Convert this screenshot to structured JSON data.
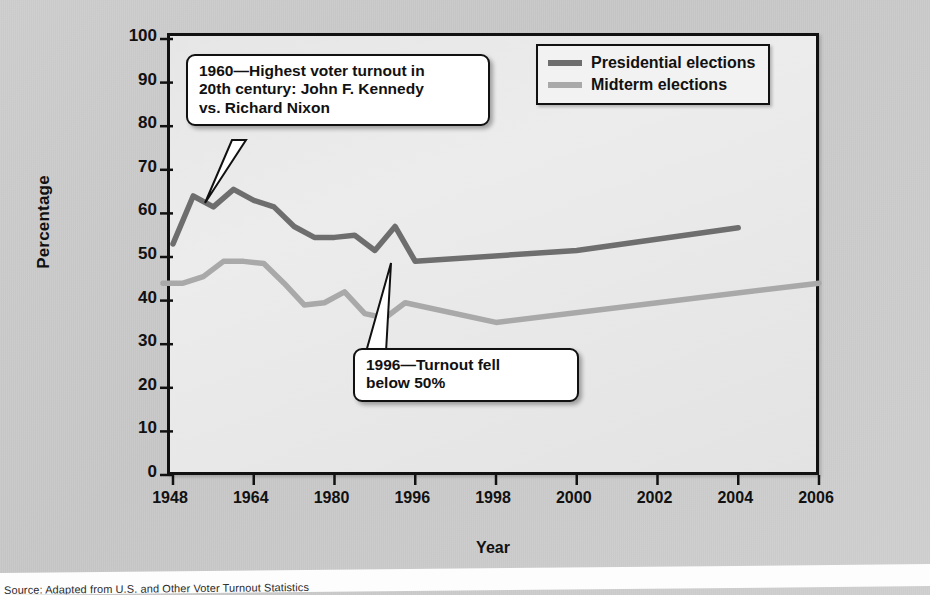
{
  "figure": {
    "ylabel": "Percentage",
    "xlabel": "Year"
  },
  "legend": {
    "position": "top-right",
    "items": [
      {
        "label": "Presidential elections",
        "color": "#6e6e6e"
      },
      {
        "label": "Midterm elections",
        "color": "#a9a9a9"
      }
    ]
  },
  "callouts": [
    {
      "name": "callout-1960",
      "text": "1960—Highest voter turnout in\n20th century: John F. Kennedy\nvs. Richard Nixon"
    },
    {
      "name": "callout-1996",
      "text": "1996—Turnout fell\nbelow 50%"
    }
  ],
  "caption": {
    "text": "Source: Adapted from U.S. and Other Voter Turnout Statistics"
  },
  "chart_data": {
    "type": "line",
    "title": "",
    "xlabel": "Year",
    "ylabel": "Percentage",
    "ylim": [
      0,
      100
    ],
    "yticks": [
      0,
      10,
      20,
      30,
      40,
      50,
      60,
      70,
      80,
      90,
      100
    ],
    "xticks": [
      "1948",
      "1964",
      "1980",
      "1996",
      "1998",
      "2000",
      "2002",
      "2004",
      "2006"
    ],
    "xtick_note": "Axis is non-linear: evenly spaced ticks cover 16-year gaps up to 1996, then 2-year gaps",
    "grid": false,
    "legend_position": "top-right",
    "series": [
      {
        "name": "Presidential elections",
        "color": "#6e6e6e",
        "points": [
          {
            "year": 1948,
            "value": 53
          },
          {
            "year": 1952,
            "value": 64
          },
          {
            "year": 1956,
            "value": 61.5
          },
          {
            "year": 1960,
            "value": 65.5
          },
          {
            "year": 1964,
            "value": 63
          },
          {
            "year": 1968,
            "value": 61.5
          },
          {
            "year": 1972,
            "value": 57
          },
          {
            "year": 1976,
            "value": 54.5
          },
          {
            "year": 1980,
            "value": 54.5
          },
          {
            "year": 1984,
            "value": 55
          },
          {
            "year": 1988,
            "value": 51.5
          },
          {
            "year": 1992,
            "value": 57
          },
          {
            "year": 1996,
            "value": 49
          },
          {
            "year": 2000,
            "value": 51.5
          },
          {
            "year": 2004,
            "value": 56.7
          }
        ]
      },
      {
        "name": "Midterm elections",
        "color": "#a9a9a9",
        "points": [
          {
            "year": 1946,
            "value": 44
          },
          {
            "year": 1950,
            "value": 44
          },
          {
            "year": 1954,
            "value": 45.5
          },
          {
            "year": 1958,
            "value": 49
          },
          {
            "year": 1962,
            "value": 49
          },
          {
            "year": 1966,
            "value": 48.5
          },
          {
            "year": 1970,
            "value": 44
          },
          {
            "year": 1974,
            "value": 39
          },
          {
            "year": 1978,
            "value": 39.5
          },
          {
            "year": 1982,
            "value": 42
          },
          {
            "year": 1986,
            "value": 37
          },
          {
            "year": 1990,
            "value": 36
          },
          {
            "year": 1994,
            "value": 39.5
          },
          {
            "year": 1998,
            "value": 35
          },
          {
            "year": 2002,
            "value": 39.5
          },
          {
            "year": 2006,
            "value": 44
          }
        ]
      }
    ],
    "annotations": [
      {
        "year": 1960,
        "value": 65.5,
        "text": "1960—Highest voter turnout in 20th century: John F. Kennedy vs. Richard Nixon"
      },
      {
        "year": 1996,
        "value": 49,
        "text": "1996—Turnout fell below 50%"
      }
    ]
  }
}
